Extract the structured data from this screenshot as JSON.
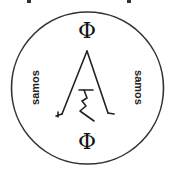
{
  "seal": {
    "top_symbol": "Φ",
    "bottom_symbol": "Φ",
    "left_text": "samos",
    "right_text": "samos",
    "center_glyph": "ξ",
    "stroke_color": "#222222",
    "background_color": "#ffffff"
  }
}
